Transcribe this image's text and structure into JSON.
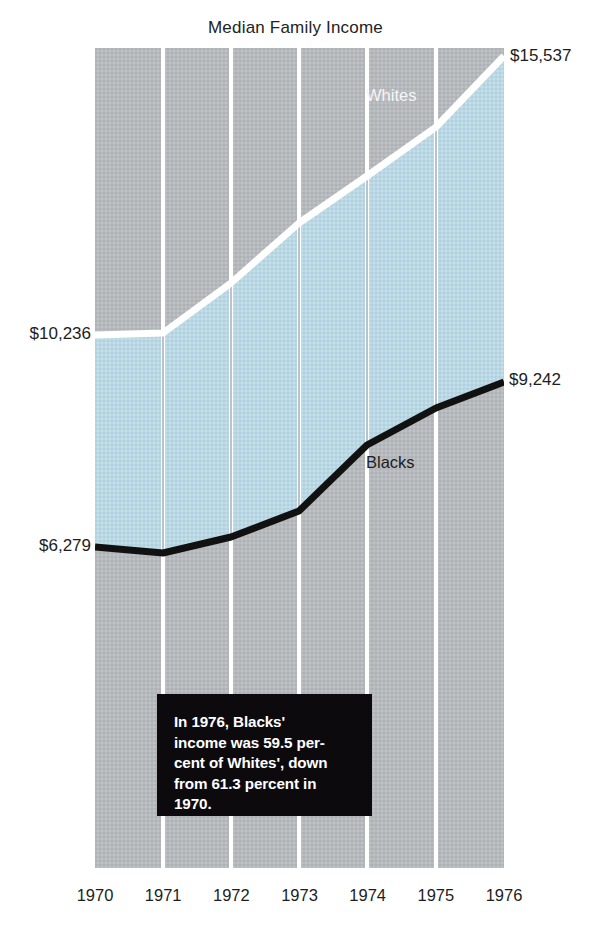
{
  "chart_data": {
    "type": "area",
    "title": "Median Family Income",
    "xlabel": "",
    "ylabel": "",
    "categories": [
      "1970",
      "1971",
      "1972",
      "1973",
      "1974",
      "1975",
      "1976"
    ],
    "grid": true,
    "legend_position": "inline-on-series",
    "ylim": [
      0,
      17000
    ],
    "series": [
      {
        "name": "Whites",
        "color": "#ffffff",
        "values": [
          10236,
          10672,
          11549,
          12595,
          13408,
          14268,
          15537
        ],
        "start_label": "$10,236",
        "end_label": "$15,537"
      },
      {
        "name": "Blacks",
        "color": "#111111",
        "values": [
          6279,
          6440,
          6864,
          7269,
          7808,
          8779,
          9242
        ],
        "start_label": "$6,279",
        "end_label": "$9,242"
      }
    ],
    "band_fill_color": "#b9d6e3",
    "background_color": "#b4b7ba",
    "annotation": "In 1976, Blacks'\nincome was 59.5 per-\ncent of Whites', down\nfrom 61.3 percent in\n1970."
  },
  "labels": {
    "whites_start": "$10,236",
    "whites_end": "$15,537",
    "blacks_start": "$6,279",
    "blacks_end": "$9,242",
    "series_whites": "Whites",
    "series_blacks": "Blacks"
  }
}
